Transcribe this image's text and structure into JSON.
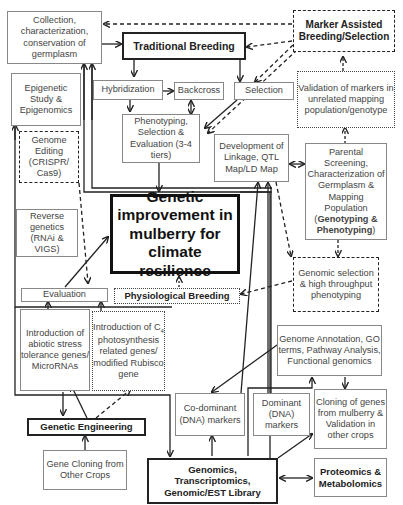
{
  "diagram": {
    "title": "Genetic improvement in mulberry for climate resilience",
    "nodes": {
      "collection": "Collection, characterization, conservation of germplasm",
      "traditional": "Traditional Breeding",
      "mas": "Marker Assisted Breeding/Selection",
      "epigenetic": "Epigenetic Study & Epigenomics",
      "hybridization": "Hybridization",
      "backcross": "Backcross",
      "selection": "Selection",
      "validation": "Validation of markers in unrelated mapping population/genotype",
      "genome_editing": "Genome Editing (CRISPR/ Cas9)",
      "phenotyping": "Phenotyping, Selection & Evaluation (3-4 tiers)",
      "linkage": "Development of Linkage, QTL Map/LD Map",
      "parental_a": "Parental Screening, Characterization of Germplasm & Mapping Population (",
      "parental_b": "Genotyping & Phenotyping",
      "parental_c": ")",
      "reverse": "Reverse genetics (RNAi & VIGS)",
      "center": "Genetic improvement in mulberry for climate resilience",
      "genomic_selection": "Genomic selection & high throughput phenotyping",
      "evaluation": "Evaluation",
      "physiological": "Physiological Breeding",
      "abiotic": "Introduction of abiotic stress tolerance genes/ MicroRNAs",
      "c4_a": "Introduction of C",
      "c4_sub": "4",
      "c4_b": "photosynthesis related genes/ modified Rubisco gene",
      "annotation": "Genome Annotation, GO terms, Pathway Analysis, Functional genomics",
      "codominant": "Co-dominant (DNA) markers",
      "dominant": "Dominant (DNA) markers",
      "cloning_mulberry": "Cloning of genes from mulberry & Validation in other crops",
      "genetic_engineering": "Genetic Engineering",
      "gene_cloning": "Gene Cloning from Other Crops",
      "genomics": "Genomics, Transcriptomics, Genomic/EST Library",
      "proteomics": "Proteomics & Metabolomics"
    }
  }
}
